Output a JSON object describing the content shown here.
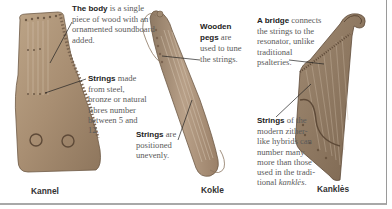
{
  "instruments": [
    {
      "name": "Kannel",
      "callouts": [
        {
          "bold": "The body",
          "text": " is a single piece of wood with an ornamented soundboard added."
        },
        {
          "bold": "Strings",
          "text": " made from steel, bronze or natural fibres number between 5 and 12."
        }
      ]
    },
    {
      "name": "Kokle",
      "callouts": [
        {
          "bold": "Wooden pegs",
          "text": " are used to tune the strings."
        },
        {
          "bold": "Strings",
          "text": " are positioned unevenly."
        }
      ]
    },
    {
      "name": "Kanklės",
      "callouts": [
        {
          "bold": "A bridge",
          "text": " connects the strings to the resonator, unlike traditional psalteries."
        },
        {
          "bold": "Strings",
          "text": " of the modern zither-like hybrids can number many more than those used in the tradi-tional ",
          "italic": "kanklės",
          "tail": "."
        }
      ]
    }
  ],
  "colors": {
    "wood_light": "#b49a7c",
    "wood_mid": "#9c8266",
    "wood_dark": "#6e5a46",
    "border": "#a0a0a0"
  }
}
